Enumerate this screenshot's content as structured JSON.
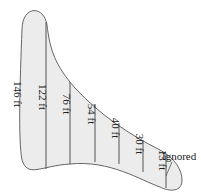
{
  "diagram": {
    "title": "",
    "fill_color": "#ececec",
    "stroke_color": "#666666",
    "widths": [
      {
        "label": "146 ft",
        "x": 14,
        "y": 94
      },
      {
        "label": "122 ft",
        "x": 39,
        "y": 97
      },
      {
        "label": "76 ft",
        "x": 63,
        "y": 104
      },
      {
        "label": "54 ft",
        "x": 88,
        "y": 114
      },
      {
        "label": "40 ft",
        "x": 112,
        "y": 128
      },
      {
        "label": "30 ft",
        "x": 136,
        "y": 144
      },
      {
        "label": "13 ft",
        "x": 159,
        "y": 160
      }
    ],
    "annotation": {
      "label": "Ignored",
      "x": 162,
      "y": 153
    }
  }
}
